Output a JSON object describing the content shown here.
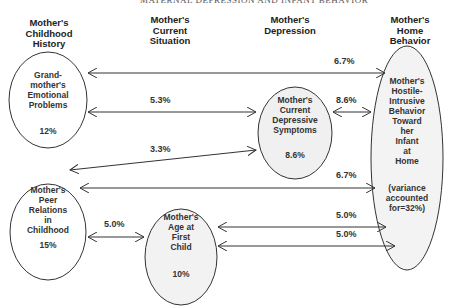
{
  "running_header": "MATERNAL DEPRESSION AND INFANT BEHAVIOR",
  "columns": [
    {
      "id": "childhood",
      "label": "Mother's\nChildhood\nHistory"
    },
    {
      "id": "current",
      "label": "Mother's\nCurrent\nSituation"
    },
    {
      "id": "depression",
      "label": "Mother's\nDepression"
    },
    {
      "id": "home",
      "label": "Mother's\nHome\nBehavior"
    }
  ],
  "nodes": {
    "grandmother": {
      "label": "Grand-\nmother's\nEmotional\nProblems",
      "value": "12%"
    },
    "peer": {
      "label": "Mother's\nPeer\nRelations\nin\nChildhood",
      "value": "15%"
    },
    "age": {
      "label": "Mother's\nAge at\nFirst\nChild",
      "value": "10%"
    },
    "depressive": {
      "label": "Mother's\nCurrent\nDepressive\nSymptoms",
      "value": "8.6%"
    },
    "hostile": {
      "label": "Mother's\nHostile-\nIntrusive\nBehavior\nToward\nher\nInfant\nat\nHome",
      "value": "(variance\naccounted\nfor=32%)"
    }
  },
  "edges": [
    {
      "from": "grandmother",
      "to": "hostile",
      "value": "6.7%"
    },
    {
      "from": "grandmother",
      "to": "depressive",
      "value": "5.3%"
    },
    {
      "from": "depressive",
      "to": "hostile",
      "value": "8.6%"
    },
    {
      "from": "peer",
      "to": "depressive",
      "value": "3.3%"
    },
    {
      "from": "peer",
      "to": "hostile",
      "value": "6.7%"
    },
    {
      "from": "peer",
      "to": "age",
      "value": "5.0%"
    },
    {
      "from": "age",
      "to": "hostile",
      "value": "5.0%",
      "position": "upper"
    },
    {
      "from": "age",
      "to": "hostile",
      "value": "5.0%",
      "position": "lower"
    }
  ]
}
